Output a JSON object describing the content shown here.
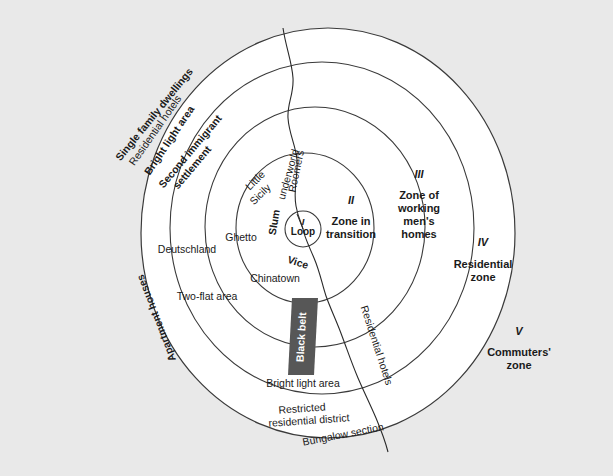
{
  "figure": {
    "type": "concentric-zone-diagram",
    "background_color": "#e9e9e9",
    "paper_color": "#ffffff",
    "line_color": "#3a3a3a",
    "black_belt_color": "#575757"
  },
  "center": {
    "roman": "I",
    "label": "Loop"
  },
  "zones": [
    {
      "roman": "II",
      "name": "Zone in\ntransition"
    },
    {
      "roman": "III",
      "name": "Zone of\nworking\nmen's\nhomes"
    },
    {
      "roman": "IV",
      "name": "Residential\nzone"
    },
    {
      "roman": "V",
      "name": "Commuters'\nzone"
    }
  ],
  "inner_ring_labels": [
    "Little\nSicily",
    "Roomers\nunderworld",
    "Slum",
    "Ghetto",
    "Vice",
    "Chinatown"
  ],
  "mid_ring_labels": [
    "Deutschland",
    "Two-flat area",
    "Black belt",
    "Bright light area",
    "Residential hotels"
  ],
  "outer_ring_labels": [
    "Single family dwellings",
    "Residential hotels",
    "Bright light area",
    "Second immigrant\nsettlement",
    "Apartment houses",
    "Restricted\nresidential district",
    "Bungalow section"
  ],
  "labels": {
    "little_sicily": "Little",
    "little_sicily2": "Sicily",
    "roomers": "Roomers",
    "underworld": "underworld",
    "slum": "Slum",
    "ghetto": "Ghetto",
    "vice": "Vice",
    "chinatown": "Chinatown",
    "deutschland": "Deutschland",
    "two_flat_area": "Two-flat area",
    "black_belt": "Black belt",
    "bright_light_area_inner": "Bright light area",
    "residential_hotels_mid": "Residential hotels",
    "single_family_dwellings": "Single family dwellings",
    "residential_hotels_outer": "Residential hotels",
    "bright_light_area_outer": "Bright light area",
    "second_immigrant": "Second immigrant",
    "settlement": "settlement",
    "apartment_houses": "Apartment houses",
    "restricted": "Restricted",
    "residential_district": "residential district",
    "bungalow_section": "Bungalow section",
    "zone2_roman": "II",
    "zone2_l1": "Zone in",
    "zone2_l2": "transition",
    "zone3_roman": "III",
    "zone3_l1": "Zone of",
    "zone3_l2": "working",
    "zone3_l3": "men's",
    "zone3_l4": "homes",
    "zone4_roman": "IV",
    "zone4_l1": "Residential",
    "zone4_l2": "zone",
    "zone5_roman": "V",
    "zone5_l1": "Commuters'",
    "zone5_l2": "zone",
    "loop_roman": "I",
    "loop_label": "Loop"
  }
}
